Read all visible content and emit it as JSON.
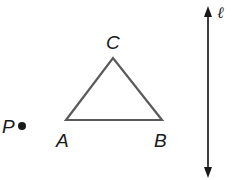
{
  "diagram": {
    "points": {
      "P": {
        "label": "P",
        "x": 22,
        "y": 126
      },
      "A": {
        "label": "A",
        "x": 66,
        "y": 120
      },
      "B": {
        "label": "B",
        "x": 162,
        "y": 120
      },
      "C": {
        "label": "C",
        "x": 113,
        "y": 58
      }
    },
    "triangle": {
      "vertices": [
        "A",
        "B",
        "C"
      ],
      "stroke": "#5a5a5a"
    },
    "line": {
      "label": "ℓ",
      "x": 208,
      "y1": 8,
      "y2": 175,
      "arrows": "both",
      "stroke": "#2a2a2a"
    }
  }
}
